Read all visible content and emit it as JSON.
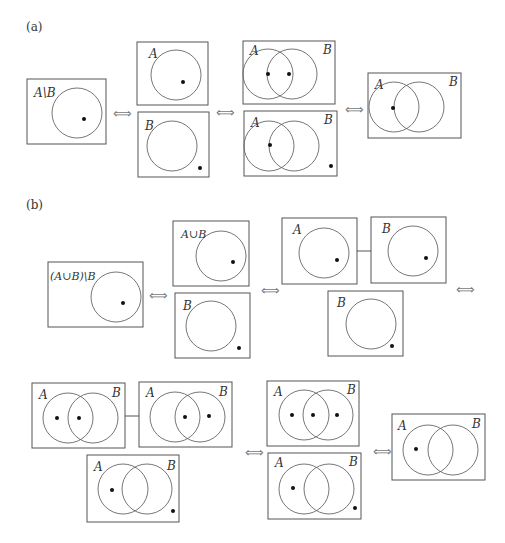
{
  "panels": {
    "a": {
      "label": "(a)",
      "arrow": "⟺",
      "diagrams": [
        {
          "name": "A-minus-B",
          "label": "A\\B"
        },
        {
          "name": "A",
          "label": "A"
        },
        {
          "name": "B",
          "label": "B"
        },
        {
          "name": "AB-two-points",
          "labelA": "A",
          "labelB": "B"
        },
        {
          "name": "AB-point-and-outside",
          "labelA": "A",
          "labelB": "B"
        },
        {
          "name": "AB-result",
          "labelA": "A",
          "labelB": "B"
        }
      ]
    },
    "b": {
      "label": "(b)",
      "arrow": "⟺",
      "diagrams": [
        {
          "name": "AuB-minus-B",
          "label": "(A∪B)\\B"
        },
        {
          "name": "AuB",
          "label": "A∪B"
        },
        {
          "name": "B",
          "label": "B"
        },
        {
          "name": "A-pair",
          "label": "A"
        },
        {
          "name": "B-pair",
          "label": "B"
        },
        {
          "name": "B-outside",
          "label": "B"
        }
      ],
      "row2": [
        {
          "name": "AB-left-mid",
          "labelA": "A",
          "labelB": "B"
        },
        {
          "name": "AB-mid-right",
          "labelA": "A",
          "labelB": "B"
        },
        {
          "name": "AB-left-outside",
          "labelA": "A",
          "labelB": "B"
        },
        {
          "name": "AB-three-points",
          "labelA": "A",
          "labelB": "B"
        },
        {
          "name": "AB-left-outside-2",
          "labelA": "A",
          "labelB": "B"
        },
        {
          "name": "AB-result",
          "labelA": "A",
          "labelB": "B"
        }
      ]
    }
  }
}
